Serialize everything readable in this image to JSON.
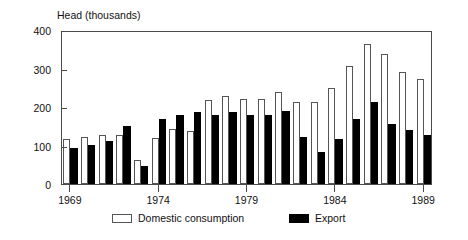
{
  "chart_data": {
    "type": "bar",
    "title": "Head (thousands)",
    "xlabel": "",
    "ylabel": "Head (thousands)",
    "ylim": [
      0,
      400
    ],
    "yticks": [
      0,
      100,
      200,
      300,
      400
    ],
    "xticks": [
      "1969",
      "1974",
      "1979",
      "1984",
      "1989"
    ],
    "grid": false,
    "legend_position": "bottom",
    "categories": [
      "1969",
      "1970",
      "1971",
      "1972",
      "1973",
      "1974",
      "1975",
      "1976",
      "1977",
      "1978",
      "1979",
      "1980",
      "1981",
      "1982",
      "1983",
      "1984",
      "1985",
      "1986",
      "1987",
      "1988",
      "1989"
    ],
    "series": [
      {
        "name": "Domestic consumption",
        "color": "#ffffff",
        "values": [
          117,
          122,
          128,
          127,
          62,
          120,
          143,
          137,
          217,
          228,
          222,
          222,
          240,
          212,
          213,
          250,
          307,
          363,
          338,
          291,
          273
        ]
      },
      {
        "name": "Export",
        "color": "#000000",
        "values": [
          93,
          102,
          113,
          151,
          46,
          168,
          180,
          188,
          180,
          188,
          180,
          180,
          190,
          121,
          83,
          117,
          168,
          213,
          155,
          140,
          127
        ]
      }
    ]
  },
  "axes": {
    "y_ticks": [
      {
        "label": "400",
        "value": 400
      },
      {
        "label": "300",
        "value": 300
      },
      {
        "label": "200",
        "value": 200
      },
      {
        "label": "100",
        "value": 100
      },
      {
        "label": "0",
        "value": 0
      }
    ],
    "x_ticks": [
      {
        "label": "1969",
        "value": 1969
      },
      {
        "label": "1974",
        "value": 1974
      },
      {
        "label": "1979",
        "value": 1979
      },
      {
        "label": "1984",
        "value": 1984
      },
      {
        "label": "1989",
        "value": 1989
      }
    ]
  },
  "legend": {
    "items": [
      {
        "label": "Domestic consumption",
        "color": "#ffffff"
      },
      {
        "label": "Export",
        "color": "#000000"
      }
    ]
  },
  "colors": {
    "domestic": "#ffffff",
    "export": "#000000",
    "axis": "#4a4a4a",
    "text": "#111111",
    "background": "#ffffff"
  }
}
